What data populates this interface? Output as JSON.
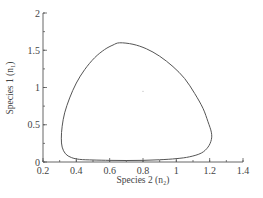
{
  "chart_data": {
    "type": "line",
    "title": "",
    "xlabel": "Species 2 (n₂)",
    "ylabel": "Species 1 (n₁)",
    "xlim": [
      0.2,
      1.4
    ],
    "ylim": [
      0,
      2
    ],
    "xticks": [
      0.2,
      0.4,
      0.6,
      0.8,
      1,
      1.2,
      1.4
    ],
    "xtick_labels": [
      "0.2",
      "0.4",
      "0.6",
      "0.8",
      "1",
      "1.2",
      "1.4"
    ],
    "yticks": [
      0,
      0.5,
      1,
      1.5,
      2
    ],
    "ytick_labels": [
      "0",
      "0.5",
      "1",
      "1.5",
      "2"
    ],
    "x_minor_step": 0.1,
    "y_minor_step": 0.25,
    "grid": false,
    "legend": null,
    "series": [
      {
        "name": "limit cycle",
        "closed": true,
        "color": "#555555",
        "points": [
          [
            0.66,
            1.6
          ],
          [
            0.74,
            1.58
          ],
          [
            0.82,
            1.52
          ],
          [
            0.9,
            1.42
          ],
          [
            0.98,
            1.28
          ],
          [
            1.05,
            1.12
          ],
          [
            1.11,
            0.92
          ],
          [
            1.16,
            0.72
          ],
          [
            1.19,
            0.54
          ],
          [
            1.21,
            0.4
          ],
          [
            1.21,
            0.3
          ],
          [
            1.19,
            0.2
          ],
          [
            1.15,
            0.12
          ],
          [
            1.08,
            0.07
          ],
          [
            1.0,
            0.045
          ],
          [
            0.9,
            0.03
          ],
          [
            0.8,
            0.022
          ],
          [
            0.7,
            0.02
          ],
          [
            0.6,
            0.022
          ],
          [
            0.5,
            0.027
          ],
          [
            0.42,
            0.035
          ],
          [
            0.37,
            0.06
          ],
          [
            0.335,
            0.11
          ],
          [
            0.315,
            0.2
          ],
          [
            0.31,
            0.32
          ],
          [
            0.315,
            0.48
          ],
          [
            0.33,
            0.66
          ],
          [
            0.36,
            0.86
          ],
          [
            0.4,
            1.06
          ],
          [
            0.45,
            1.24
          ],
          [
            0.51,
            1.4
          ],
          [
            0.57,
            1.51
          ],
          [
            0.62,
            1.57
          ],
          [
            0.66,
            1.6
          ]
        ]
      }
    ],
    "annotations": [
      {
        "text": "·",
        "x": 0.8,
        "y": 0.95
      }
    ]
  }
}
